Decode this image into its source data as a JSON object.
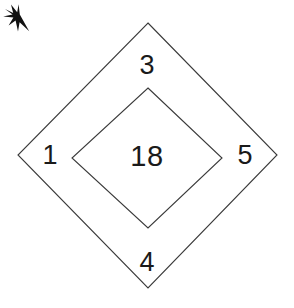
{
  "figure": {
    "type": "nested-diamond-puzzle",
    "background_color": "#ffffff",
    "line_color": "#3a3a3a",
    "text_color": "#1a1a1a",
    "outer_diamond": {
      "label": "outer-diamond",
      "vertices": [
        [
          148,
          23
        ],
        [
          277,
          155
        ],
        [
          148,
          288
        ],
        [
          18,
          155
        ]
      ]
    },
    "inner_diamond": {
      "label": "inner-diamond",
      "vertices": [
        [
          148,
          88
        ],
        [
          222,
          158
        ],
        [
          148,
          228
        ],
        [
          72,
          158
        ]
      ]
    },
    "labels": {
      "top": "3",
      "left": "1",
      "right": "5",
      "bottom": "4",
      "center": "18"
    },
    "pointer": {
      "icon": "arrow-cursor-icon",
      "direction": "down-right",
      "tip": [
        113,
        121
      ],
      "color": "#111111"
    }
  }
}
